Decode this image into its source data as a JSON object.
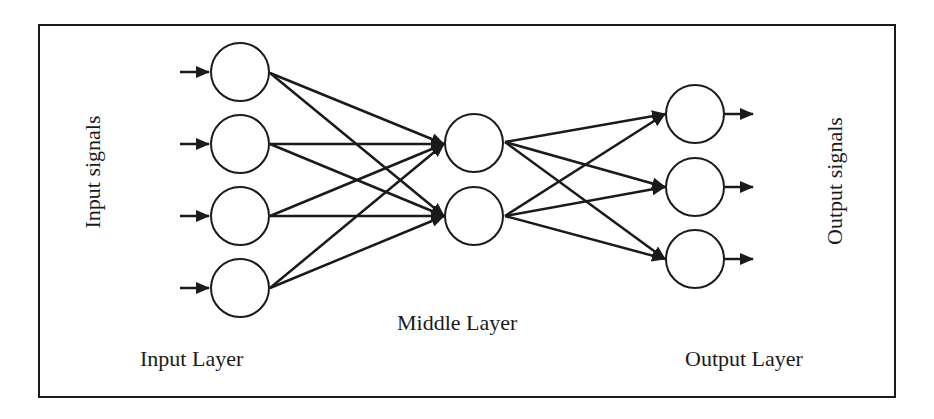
{
  "diagram": {
    "type": "feedforward-neural-network",
    "labels": {
      "input_signals": "Input signals",
      "output_signals": "Output signals",
      "input_layer": "Input Layer",
      "middle_layer": "Middle Layer",
      "output_layer": "Output Layer"
    },
    "layers": [
      {
        "name": "Input Layer",
        "node_count": 4
      },
      {
        "name": "Middle Layer",
        "node_count": 2
      },
      {
        "name": "Output Layer",
        "node_count": 3
      }
    ],
    "connections": "fully-connected",
    "colors": {
      "stroke": "#1a1a1a",
      "node_fill": "#ffffff",
      "background": "#ffffff"
    }
  }
}
